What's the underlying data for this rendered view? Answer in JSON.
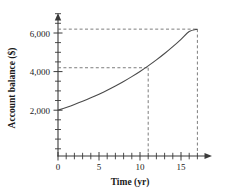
{
  "chart_data": {
    "type": "line",
    "title": "",
    "xlabel": "Time (yr)",
    "ylabel": "Account balance ($)",
    "xlim": [
      0,
      18.8
    ],
    "ylim": [
      0,
      7200
    ],
    "grid": false,
    "legend": null,
    "x_ticks_major": [
      0,
      5,
      10,
      15
    ],
    "x_tick_labels": [
      "0",
      "5",
      "10",
      "15"
    ],
    "x_ticks_minor": [
      1,
      2,
      3,
      4,
      6,
      7,
      8,
      9,
      11,
      12,
      13,
      14,
      16,
      17
    ],
    "y_ticks_major": [
      2000,
      4000,
      6000
    ],
    "y_tick_labels": [
      "2,000",
      "4,000",
      "6,000"
    ],
    "y_ticks_minor": [
      1000,
      3000,
      5000,
      7000
    ],
    "series": [
      {
        "name": "Account balance",
        "x": [
          0,
          1,
          2,
          3,
          4,
          5,
          6,
          7,
          8,
          9,
          10,
          11,
          12,
          13,
          14,
          15,
          16,
          17
        ],
        "values": [
          2000,
          2144,
          2298,
          2464,
          2641,
          2832,
          3035,
          3254,
          3488,
          3739,
          4008,
          4296,
          4605,
          4936,
          5291,
          5672,
          6080,
          6200
        ]
      }
    ],
    "annotations": [
      {
        "name": "guide-at-year-11",
        "x": 11,
        "y": 4200,
        "style": "dashed",
        "kind": "crosshair"
      },
      {
        "name": "guide-at-year-17",
        "x": 17,
        "y": 6200,
        "style": "dashed",
        "kind": "crosshair"
      }
    ],
    "colors": {
      "curve": "#4a4a4a",
      "axis": "#3a3a3a",
      "dashed_guide": "#6e6e6e",
      "background": "#ffffff",
      "text": "#1a1a1a"
    }
  }
}
